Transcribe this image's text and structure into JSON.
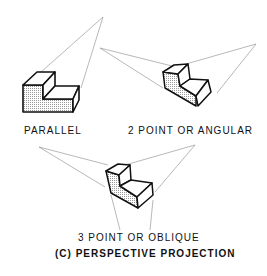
{
  "figure": {
    "labels": {
      "parallel": "PARALLEL",
      "two_point": "2 POINT OR ANGULAR",
      "three_point": "3 POINT OR OBLIQUE",
      "caption": "(C)  PERSPECTIVE PROJECTION"
    },
    "colors": {
      "ink": "#111111",
      "projector": "#777777",
      "shade": "#d8d8d8"
    }
  }
}
